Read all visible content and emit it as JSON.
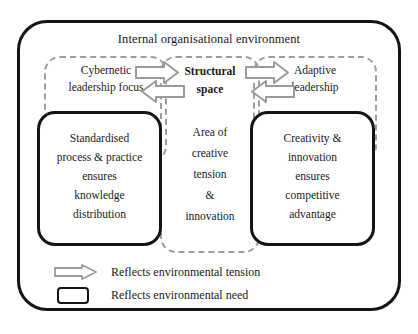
{
  "figure": {
    "type": "conceptual-framework-diagram",
    "title": "Internal organisational environment",
    "caption": ""
  },
  "zones": {
    "left": {
      "name": "cybernetic-leadership-zone",
      "heading_line1": "Cybernetic",
      "heading_line2": "leadership focus"
    },
    "center": {
      "name": "structural-space-zone",
      "heading_line1": "Structural",
      "heading_line2": "space",
      "body": [
        "Area of",
        "creative",
        "tension",
        "&",
        "innovation"
      ]
    },
    "right": {
      "name": "adaptive-leadership-zone",
      "heading_line1": "Adaptive",
      "heading_line2": "leadership"
    }
  },
  "need_boxes": {
    "left": {
      "name": "standardised-process-box",
      "lines": [
        "Standardised",
        "process & practice",
        "ensures",
        "knowledge",
        "distribution"
      ]
    },
    "right": {
      "name": "creativity-innovation-box",
      "lines": [
        "Creativity &",
        "innovation",
        "ensures",
        "competitive",
        "advantage"
      ]
    }
  },
  "legend": {
    "items": [
      {
        "icon": "block-arrow-icon",
        "label": "Reflects environmental tension"
      },
      {
        "icon": "rounded-rectangle-icon",
        "label": "Reflects environmental need"
      }
    ]
  },
  "colors": {
    "outline": "#141414",
    "dashed": "#9d9d9d",
    "arrow_stroke": "#8f8f8f",
    "arrow_fill": "#ffffff",
    "background": "#ffffff",
    "text": "#1a1a1a"
  }
}
